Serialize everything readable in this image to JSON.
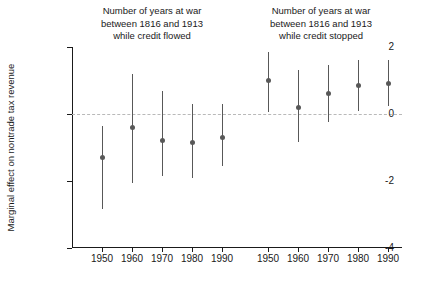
{
  "chart_data": {
    "type": "scatter",
    "title": "",
    "xlabel": "",
    "ylabel": "Marginal effect on nontrade tax revenue",
    "ylim": [
      -4,
      2
    ],
    "yticks": [
      2,
      0,
      -2,
      -4
    ],
    "ytick_labels": [
      "2",
      "0",
      "-2",
      "-4"
    ],
    "grid": false,
    "legend": false,
    "zero_reference_line": 0,
    "groups": [
      {
        "name": "credit-flowed",
        "title": "Number of years at war\nbetween 1816 and 1913\nwhile credit flowed",
        "categories": [
          "1950",
          "1960",
          "1970",
          "1980",
          "1990"
        ],
        "values": [
          -1.3,
          -0.4,
          -0.8,
          -0.85,
          -0.7
        ],
        "ci_low": [
          -2.85,
          -2.05,
          -1.85,
          -1.9,
          -1.55
        ],
        "ci_high": [
          -0.35,
          1.2,
          0.7,
          0.3,
          0.3
        ]
      },
      {
        "name": "credit-stopped",
        "title": "Number of years at war\nbetween 1816 and 1913\nwhile credit stopped",
        "categories": [
          "1950",
          "1960",
          "1970",
          "1980",
          "1990"
        ],
        "values": [
          1.0,
          0.2,
          0.62,
          0.85,
          0.92
        ],
        "ci_low": [
          0.05,
          -0.85,
          -0.25,
          0.1,
          0.25
        ],
        "ci_high": [
          1.85,
          1.3,
          1.45,
          1.6,
          1.6
        ]
      }
    ],
    "colors": {
      "marker": "#585858",
      "error_bar": "#585858",
      "axis": "#1a1a1a",
      "zero_line": "#b9b9b9",
      "background": "#ffffff"
    }
  }
}
